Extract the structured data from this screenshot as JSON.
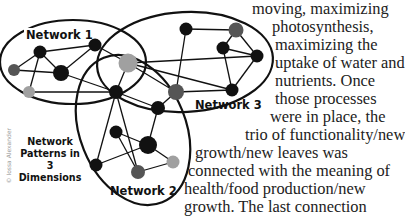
{
  "diagram": {
    "title_lines": [
      "Network",
      "Patterns in 3",
      "Dimensions"
    ],
    "credit": "© Iossa Alexander",
    "networks": [
      {
        "label": "Network 1"
      },
      {
        "label": "Network 2"
      },
      {
        "label": "Network 3"
      }
    ],
    "node_colors": {
      "black": "#111111",
      "dark_gray": "#555555",
      "light_gray": "#a0a0a0"
    }
  },
  "article": {
    "lines": [
      "moving, maximizing",
      "photosynthesis,",
      "maximizing the",
      "uptake of water and",
      "nutrients. Once",
      "those processes",
      "were in place, the",
      "trio of functionality/new",
      "growth/new leaves was",
      "connected with the meaning of",
      "health/food production/new",
      "growth. The last connection"
    ]
  }
}
